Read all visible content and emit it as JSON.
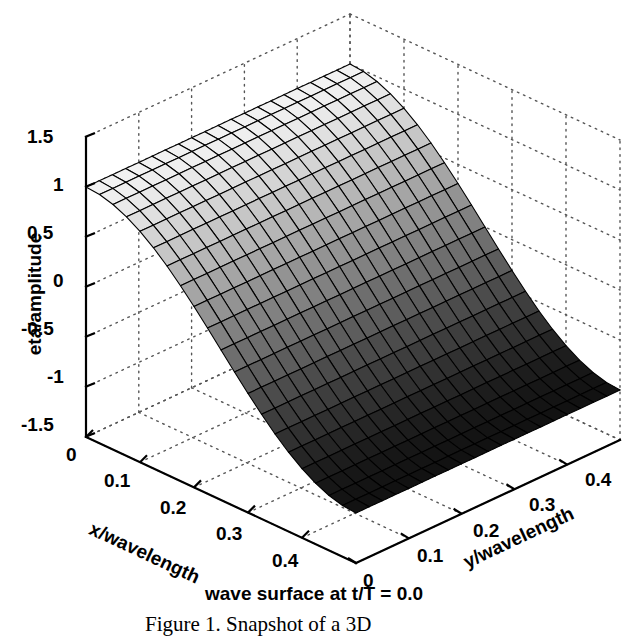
{
  "figure": {
    "subcaption": "wave surface at  t/T = 0.0",
    "figure_caption": "Figure 1.  Snapshot of a 3D"
  },
  "axes": {
    "z_label": "eta/amplitude",
    "x_label": "x/wavelength",
    "y_label": "y/wavelength",
    "z_ticks": [
      "1.5",
      "1",
      "0.5",
      "0",
      "-0.5",
      "-1",
      "-1.5"
    ],
    "x_ticks": [
      "0",
      "0.1",
      "0.2",
      "0.3",
      "0.4"
    ],
    "y_ticks": [
      "0",
      "0.1",
      "0.2",
      "0.3",
      "0.4"
    ]
  },
  "chart_data": {
    "type": "surface",
    "title": "wave surface at  t/T = 0.0",
    "xlabel": "x/wavelength",
    "ylabel": "y/wavelength",
    "zlabel": "eta/amplitude",
    "xlim": [
      0,
      0.5
    ],
    "ylim": [
      0,
      0.5
    ],
    "zlim": [
      -1.5,
      1.5
    ],
    "xticks": [
      0,
      0.1,
      0.2,
      0.3,
      0.4
    ],
    "yticks": [
      0,
      0.1,
      0.2,
      0.3,
      0.4
    ],
    "zticks": [
      -1.5,
      -1,
      -0.5,
      0,
      0.5,
      1,
      1.5
    ],
    "grid": true,
    "legend": null,
    "colormap": "gray",
    "surface_formula": "z = cos(2*pi*x)  (independent of y)",
    "nx": 21,
    "ny": 21,
    "x": [
      0,
      0.025,
      0.05,
      0.075,
      0.1,
      0.125,
      0.15,
      0.175,
      0.2,
      0.225,
      0.25,
      0.275,
      0.3,
      0.325,
      0.35,
      0.375,
      0.4,
      0.425,
      0.45,
      0.475,
      0.5
    ],
    "y": [
      0,
      0.025,
      0.05,
      0.075,
      0.1,
      0.125,
      0.15,
      0.175,
      0.2,
      0.225,
      0.25,
      0.275,
      0.3,
      0.325,
      0.35,
      0.375,
      0.4,
      0.425,
      0.45,
      0.475,
      0.5
    ],
    "z_profile_along_x": [
      1.0,
      0.988,
      0.951,
      0.891,
      0.809,
      0.707,
      0.588,
      0.454,
      0.309,
      0.156,
      0.0,
      -0.156,
      -0.309,
      -0.454,
      -0.588,
      -0.707,
      -0.809,
      -0.891,
      -0.951,
      -0.988,
      -1.0
    ],
    "zmin": -1.0,
    "zmax": 1.0,
    "view_azimuth_deg": -37.5,
    "view_elevation_deg": 30
  }
}
